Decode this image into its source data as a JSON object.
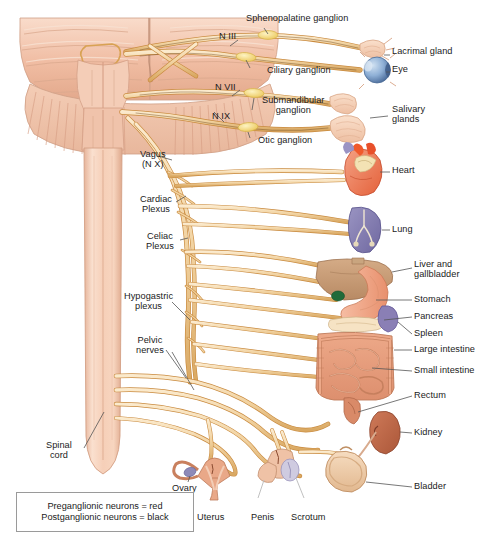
{
  "figure": {
    "background": "#ffffff"
  },
  "palette": {
    "nerve_outline": "#c98a3e",
    "nerve_fill": "#f3d7a8",
    "nerve_fill_light": "#fae9cb",
    "ganglion": "#f7e07a",
    "brain_light": "#f6cdb6",
    "brain_mid": "#eeb79c",
    "brain_dark": "#d9977c",
    "cord_light": "#f8d6c2",
    "cord_mid": "#efbda4",
    "heart_red": "#ef5a2c",
    "heart_salmon": "#f09070",
    "vessel_blue": "#9a93c4",
    "lung_purple": "#7d77ab",
    "liver_brown": "#c79a74",
    "gallbladder_green": "#1f6b3a",
    "stomach": "#f0a383",
    "spleen": "#8a7fb5",
    "intestine": "#e79b7e",
    "kidney": "#c1684c",
    "bladder": "#eec9a7",
    "eye_blue": "#7fa6cf",
    "gland": "#f3cdb4",
    "leader_line": "#5c5c5c",
    "text": "#1b1b1b",
    "legend_border": "#9a9a9a"
  },
  "labels": {
    "cranial_nerves": [
      {
        "name": "n-iii",
        "text": "N III",
        "x": 219,
        "y": 37
      },
      {
        "name": "n-vii",
        "text": "N VII",
        "x": 215,
        "y": 88
      },
      {
        "name": "n-ix",
        "text": "N IX",
        "x": 212,
        "y": 117
      }
    ],
    "ganglia": [
      {
        "name": "sphenopalatine-ganglion",
        "text": "Sphenopalatine ganglion",
        "x": 246,
        "y": 19
      },
      {
        "name": "ciliary-ganglion",
        "text": "Ciliary ganglion",
        "x": 267,
        "y": 71
      },
      {
        "name": "submandibular-ganglion",
        "text": "Submandibular\nganglion",
        "x": 262,
        "y": 101
      },
      {
        "name": "otic-ganglion",
        "text": "Otic ganglion",
        "x": 258,
        "y": 141
      }
    ],
    "nerves_plexuses": [
      {
        "name": "vagus-nerve",
        "text": "Vagus\n(N X)",
        "x": 146,
        "y": 155
      },
      {
        "name": "cardiac-plexus",
        "text": "Cardiac\nPlexus",
        "x": 147,
        "y": 200
      },
      {
        "name": "celiac-plexus",
        "text": "Celiac\nPlexus",
        "x": 152,
        "y": 237
      },
      {
        "name": "hypogastric-plexus",
        "text": "Hypogastric\nplexus",
        "x": 136,
        "y": 297
      },
      {
        "name": "pelvic-nerves",
        "text": "Pelvic\nnerves",
        "x": 146,
        "y": 341
      },
      {
        "name": "spinal-cord",
        "text": "Spinal\ncord",
        "x": 56,
        "y": 446
      }
    ],
    "organs_right": [
      {
        "name": "lacrimal-gland",
        "text": "Lacrimal gland",
        "x": 392,
        "y": 51
      },
      {
        "name": "eye",
        "text": "Eye",
        "x": 392,
        "y": 69
      },
      {
        "name": "salivary-glands",
        "text": "Salivary\nglands",
        "x": 392,
        "y": 110
      },
      {
        "name": "heart",
        "text": "Heart",
        "x": 392,
        "y": 170
      },
      {
        "name": "lung",
        "text": "Lung",
        "x": 392,
        "y": 229
      },
      {
        "name": "liver-gallbladder",
        "text": "Liver and\ngallbladder",
        "x": 414,
        "y": 264
      },
      {
        "name": "stomach",
        "text": "Stomach",
        "x": 414,
        "y": 297
      },
      {
        "name": "pancreas",
        "text": "Pancreas",
        "x": 414,
        "y": 314
      },
      {
        "name": "spleen",
        "text": "Spleen",
        "x": 414,
        "y": 331
      },
      {
        "name": "large-intestine",
        "text": "Large intestine",
        "x": 414,
        "y": 347
      },
      {
        "name": "small-intestine",
        "text": "Small intestine",
        "x": 414,
        "y": 368
      },
      {
        "name": "rectum",
        "text": "Rectum",
        "x": 414,
        "y": 393
      },
      {
        "name": "kidney",
        "text": "Kidney",
        "x": 414,
        "y": 430
      },
      {
        "name": "bladder",
        "text": "Bladder",
        "x": 414,
        "y": 484
      }
    ],
    "reproductive": [
      {
        "name": "ovary",
        "text": "Ovary",
        "x": 172,
        "y": 478
      },
      {
        "name": "uterus",
        "text": "Uterus",
        "x": 206,
        "y": 513
      },
      {
        "name": "penis",
        "text": "Penis",
        "x": 268,
        "y": 513
      },
      {
        "name": "scrotum",
        "text": "Scrotum",
        "x": 300,
        "y": 513
      }
    ]
  },
  "legend": {
    "name": "neuron-color-legend",
    "line1": "Preganglionic neurons = red",
    "line2": "Postganglionic neurons = black"
  }
}
